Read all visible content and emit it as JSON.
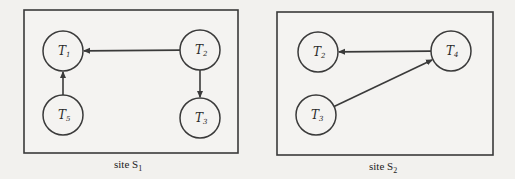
{
  "colors": {
    "background": "#f2f1ee",
    "box_fill": "#f4f3f1",
    "stroke": "#3a3a3a",
    "text": "#2a2a2a"
  },
  "sites": [
    {
      "id": "S1",
      "caption_prefix": "site S",
      "caption_sub": "1",
      "box": {
        "x": 24,
        "y": 10,
        "w": 214,
        "h": 143
      },
      "caption_pos": {
        "x": 114,
        "y": 168
      },
      "nodes": [
        {
          "id": "T1",
          "letter": "T",
          "sub": "1",
          "cx": 63,
          "cy": 51
        },
        {
          "id": "T2",
          "letter": "T",
          "sub": "2",
          "cx": 200,
          "cy": 50
        },
        {
          "id": "T5",
          "letter": "T",
          "sub": "5",
          "cx": 63,
          "cy": 115
        },
        {
          "id": "T3",
          "letter": "T",
          "sub": "3",
          "cx": 200,
          "cy": 118
        }
      ],
      "edges": [
        {
          "from": "T2",
          "to": "T1"
        },
        {
          "from": "T5",
          "to": "T1"
        },
        {
          "from": "T2",
          "to": "T3"
        }
      ]
    },
    {
      "id": "S2",
      "caption_prefix": "site S",
      "caption_sub": "2",
      "box": {
        "x": 277,
        "y": 12,
        "w": 216,
        "h": 143
      },
      "caption_pos": {
        "x": 369,
        "y": 170
      },
      "nodes": [
        {
          "id": "T2",
          "letter": "T",
          "sub": "2",
          "cx": 318,
          "cy": 52
        },
        {
          "id": "T4",
          "letter": "T",
          "sub": "4",
          "cx": 451,
          "cy": 51
        },
        {
          "id": "T3",
          "letter": "T",
          "sub": "3",
          "cx": 316,
          "cy": 115
        }
      ],
      "edges": [
        {
          "from": "T4",
          "to": "T2"
        },
        {
          "from": "T3",
          "to": "T4"
        }
      ]
    }
  ],
  "node_radius": 20
}
